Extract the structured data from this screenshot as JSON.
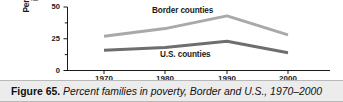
{
  "figure": {
    "number_label": "Figure 65.",
    "caption_title": "Percent families in poverty, Border and U.S., 1970–2000"
  },
  "axes": {
    "y_title_line1": "Percent families",
    "y_title_line2": "in poverty",
    "y_ticks": [
      "0",
      "25",
      "50"
    ],
    "x_ticks": [
      "1970",
      "1980",
      "1990",
      "2000"
    ]
  },
  "series_labels": {
    "border": "Border counties",
    "us": "U.S. counties"
  },
  "colors": {
    "border_line": "#a9a9a9",
    "us_line": "#6e6e6e",
    "axis": "#1a1a1a",
    "caption_band": "#ececec",
    "caption_border": "#b9b9b9",
    "text": "#1a1a1a"
  },
  "chart_data": {
    "type": "line",
    "title": "Percent families in poverty, Border and U.S., 1970–2000",
    "xlabel": "",
    "ylabel": "Percent families in poverty",
    "x": [
      1970,
      1980,
      1990,
      2000
    ],
    "xtick_labels": [
      "1970",
      "1980",
      "1990",
      "2000"
    ],
    "ytick_labels": [
      "0",
      "25",
      "50"
    ],
    "ytick_values": [
      0,
      25,
      50
    ],
    "minor_ytick_values": [
      12.5,
      37.5
    ],
    "ylim": [
      0,
      50
    ],
    "grid": false,
    "legend": "inline-annotations",
    "series": [
      {
        "name": "Border counties",
        "color": "#a9a9a9",
        "values": [
          27,
          33,
          43,
          28
        ]
      },
      {
        "name": "U.S. counties",
        "color": "#6e6e6e",
        "values": [
          16,
          18,
          23,
          14
        ]
      }
    ],
    "annotations": [
      {
        "text": "Border counties",
        "x": 1985,
        "y": 47
      },
      {
        "text": "U.S. counties",
        "x": 1983,
        "y": 9
      }
    ]
  }
}
